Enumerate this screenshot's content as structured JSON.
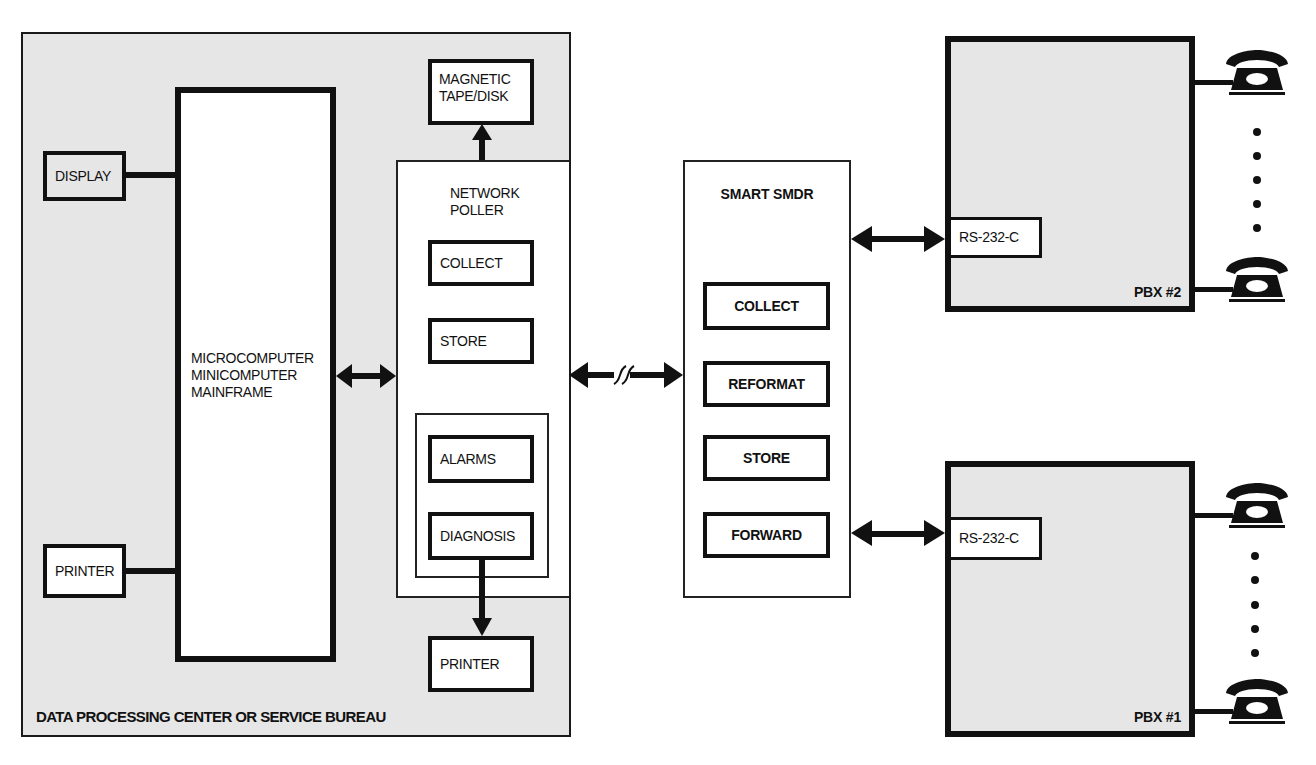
{
  "diagram": {
    "data_center": {
      "label": "DATA PROCESSING CENTER OR SERVICE BUREAU",
      "display": "DISPLAY",
      "printer_left": "PRINTER",
      "computer_lines": [
        "MICROCOMPUTER",
        "MINICOMPUTER",
        "MAINFRAME"
      ],
      "magnetic_lines": [
        "MAGNETIC",
        "TAPE/DISK"
      ],
      "poller": {
        "title_lines": [
          "NETWORK",
          "POLLER"
        ],
        "collect": "COLLECT",
        "store": "STORE",
        "alarms": "ALARMS",
        "diagnosis": "DIAGNOSIS"
      },
      "printer_bottom": "PRINTER"
    },
    "smart_smdr": {
      "title": "SMART SMDR",
      "functions": [
        "COLLECT",
        "REFORMAT",
        "STORE",
        "FORWARD"
      ]
    },
    "pbx2": {
      "label": "PBX #2",
      "port": "RS-232-C"
    },
    "pbx1": {
      "label": "PBX #1",
      "port": "RS-232-C"
    },
    "icons": {
      "telephone": "telephone-icon",
      "ellipsis": "vertical-ellipsis-icon",
      "link_break": "line-break-squiggle-icon"
    }
  }
}
